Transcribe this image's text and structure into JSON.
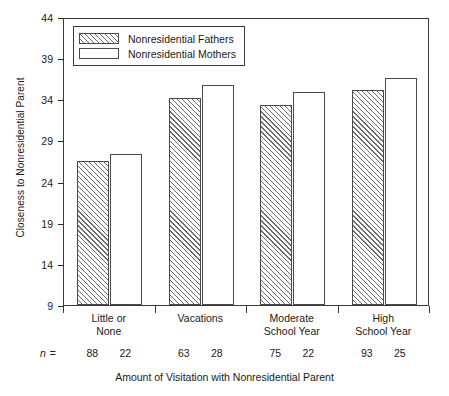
{
  "chart_data": {
    "type": "bar",
    "title": "",
    "xlabel": "Amount of Visitation with Nonresidential Parent",
    "ylabel": "Closeness to Nonresidential Parent",
    "ylim": [
      9,
      44
    ],
    "yticks": [
      44,
      39,
      34,
      29,
      24,
      19,
      14,
      9
    ],
    "grid": false,
    "legend_position": "top-left",
    "categories": [
      "Little or\nNone",
      "Vacations",
      "Moderate\nSchool Year",
      "High\nSchool Year"
    ],
    "category_lines": [
      [
        "Little or",
        "None"
      ],
      [
        "Vacations",
        ""
      ],
      [
        "Moderate",
        "School Year"
      ],
      [
        "High",
        "School Year"
      ]
    ],
    "series": [
      {
        "name": "Nonresidential Fathers",
        "pattern": "diagonal-hatch",
        "values": [
          26.5,
          34.1,
          33.3,
          35.1
        ],
        "n": [
          88,
          63,
          75,
          93
        ]
      },
      {
        "name": "Nonresidential Mothers",
        "pattern": "solid-white",
        "values": [
          27.4,
          35.7,
          34.9,
          36.6
        ],
        "n": [
          22,
          28,
          22,
          25
        ]
      }
    ],
    "n_row_label": "n =",
    "colors": {
      "axis": "#3a3a3a",
      "bar_outline": "#4a4a4a",
      "hatch": "#6b6b6b",
      "background": "#ffffff",
      "text": "#1a1a1a"
    }
  }
}
